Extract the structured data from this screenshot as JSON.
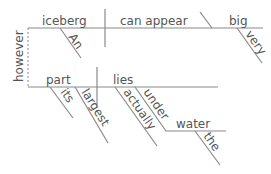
{
  "diagram": {
    "type": "sentence-diagram",
    "clause1": {
      "subject": "iceberg",
      "subject_modifiers": [
        "An"
      ],
      "verb": "can appear",
      "predicate_adjective": "big",
      "predicate_modifiers": [
        "very"
      ]
    },
    "conjunction": "however",
    "clause2": {
      "subject": "part",
      "subject_modifiers": [
        "its",
        "largest"
      ],
      "verb": "lies",
      "verb_modifiers": [
        "actually"
      ],
      "preposition": "under",
      "object_of_preposition": "water",
      "object_modifiers": [
        "the"
      ]
    },
    "colors": {
      "line": "#8a8a8a",
      "text": "#555555"
    }
  }
}
